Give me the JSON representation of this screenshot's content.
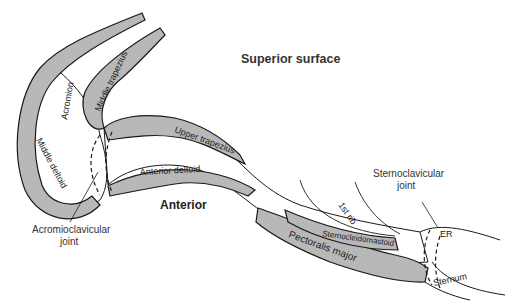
{
  "diagram": {
    "title": "Superior surface",
    "view_label": "Anterior",
    "colors": {
      "muscle_fill": "#b8b8b8",
      "outline": "#1a1a1a",
      "background": "#ffffff"
    },
    "labels": {
      "acromion": "Acromion",
      "middle_trapezius": "Middle trapezius",
      "middle_deltoid": "Middle deltoid",
      "upper_trapezius": "Upper trapezius",
      "anterior_deltoid": "Anterior deltoid",
      "first_rib": "1st rib",
      "sternocleidomastoid": "Sternocleidomastoid",
      "pectoralis_major": "Pectoralis major",
      "sternum": "Sternum",
      "er": "ER"
    },
    "callouts": {
      "acromioclavicular_line1": "Acromioclavicular",
      "acromioclavicular_line2": "joint",
      "sternoclavicular_line1": "Sternoclavicular",
      "sternoclavicular_line2": "joint"
    }
  }
}
